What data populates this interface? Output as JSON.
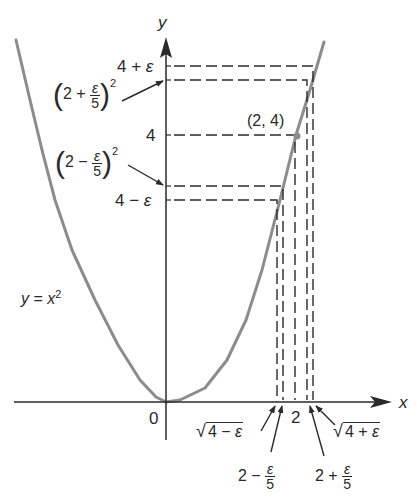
{
  "chart_data": {
    "type": "line",
    "title": "",
    "xlabel": "x",
    "ylabel": "y",
    "curve_label": "y = x²",
    "series": [
      {
        "name": "y = x^2",
        "color": "#8c8c8c",
        "left_branch_px": [
          [
            16,
            40
          ],
          [
            30,
            100
          ],
          [
            42,
            150
          ],
          [
            55,
            200
          ],
          [
            72,
            250
          ],
          [
            95,
            300
          ],
          [
            118,
            345
          ],
          [
            140,
            380
          ],
          [
            156,
            397
          ],
          [
            166,
            402
          ]
        ],
        "right_branch_px": [
          [
            166,
            402
          ],
          [
            180,
            400
          ],
          [
            205,
            388
          ],
          [
            227,
            360
          ],
          [
            246,
            320
          ],
          [
            262,
            270
          ],
          [
            280,
            200
          ],
          [
            296,
            135
          ],
          [
            310,
            90
          ],
          [
            324,
            42
          ]
        ]
      }
    ],
    "point": {
      "label": "(2, 4)",
      "x": 2,
      "y": 4
    },
    "y_ticks": [
      {
        "label": "4 + ε",
        "meaning": "4+eps"
      },
      {
        "label": "(2 + ε/5)²",
        "meaning": "(2+eps/5)^2"
      },
      {
        "label": "4",
        "meaning": "4"
      },
      {
        "label": "(2 − ε/5)²",
        "meaning": "(2-eps/5)^2"
      },
      {
        "label": "4 − ε",
        "meaning": "4-eps"
      }
    ],
    "x_ticks": [
      {
        "label": "0"
      },
      {
        "label": "√(4 − ε)"
      },
      {
        "label": "2 − ε/5"
      },
      {
        "label": "2"
      },
      {
        "label": "2 + ε/5"
      },
      {
        "label": "√(4 + ε)"
      }
    ],
    "axis_color": "#2a2a2a",
    "curve_color": "#8c8c8c"
  },
  "labels": {
    "y_axis": "y",
    "x_axis": "x",
    "origin": "0",
    "curve": {
      "y": "y",
      "eq": " = ",
      "x": "x",
      "exp": "2"
    },
    "point": "(2, 4)",
    "four_plus_eps": {
      "four": "4 + ",
      "eps": "ε"
    },
    "four_minus_eps": {
      "four": "4 − ",
      "eps": "ε"
    },
    "four": "4",
    "two": "2",
    "two_plus_frac": {
      "open": "(",
      "two": "2 + ",
      "num": "ε",
      "den": "5",
      "close": ")",
      "exp": "2"
    },
    "two_minus_frac": {
      "open": "(",
      "two": "2 − ",
      "num": "ε",
      "den": "5",
      "close": ")",
      "exp": "2"
    },
    "sqrt_minus": {
      "sym": "√",
      "body": "4 − ",
      "eps": "ε"
    },
    "sqrt_plus": {
      "sym": "√",
      "body": "4 + ",
      "eps": "ε"
    },
    "x_two_minus": {
      "two": "2 − ",
      "num": "ε",
      "den": "5"
    },
    "x_two_plus": {
      "two": "2 + ",
      "num": "ε",
      "den": "5"
    }
  }
}
